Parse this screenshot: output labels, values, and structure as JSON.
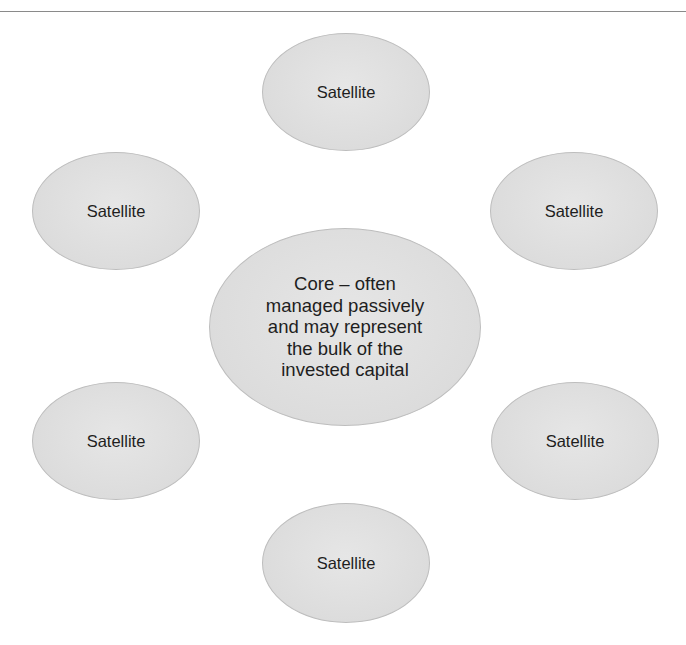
{
  "diagram": {
    "type": "hub-and-spoke",
    "core": {
      "lines": [
        "Core – often",
        "managed passively",
        "and may represent",
        "the bulk of the",
        "invested capital"
      ]
    },
    "satellites": [
      {
        "position": "top",
        "label": "Satellite"
      },
      {
        "position": "upper-left",
        "label": "Satellite"
      },
      {
        "position": "upper-right",
        "label": "Satellite"
      },
      {
        "position": "lower-left",
        "label": "Satellite"
      },
      {
        "position": "lower-right",
        "label": "Satellite"
      },
      {
        "position": "bottom",
        "label": "Satellite"
      }
    ],
    "colors": {
      "node_fill": "#dedede",
      "node_border": "#bdbdbd",
      "text": "#1e1e1e",
      "rule": "#8a8a8a"
    }
  }
}
